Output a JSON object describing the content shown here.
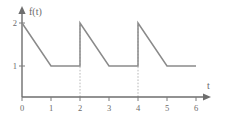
{
  "chart_data": {
    "type": "line",
    "title": "",
    "subtitle": "",
    "xlabel": "t",
    "ylabel": "f(t)",
    "xlim": [
      0,
      6
    ],
    "ylim": [
      0,
      2.3
    ],
    "grid": false,
    "legend": null,
    "x_ticks": [
      "0",
      "1",
      "2",
      "3",
      "4",
      "5",
      "6"
    ],
    "x_tick_values": [
      0,
      1,
      2,
      3,
      4,
      5,
      6
    ],
    "y_ticks": [
      "1",
      "2"
    ],
    "y_tick_values": [
      1,
      2
    ],
    "period": 2,
    "series": [
      {
        "name": "f(t)",
        "color": "#8a8a8a",
        "points": [
          {
            "x": 0,
            "y": 2
          },
          {
            "x": 1,
            "y": 1
          },
          {
            "x": 2,
            "y": 1
          },
          {
            "x": 2,
            "y": 2
          },
          {
            "x": 3,
            "y": 1
          },
          {
            "x": 4,
            "y": 1
          },
          {
            "x": 4,
            "y": 2
          },
          {
            "x": 5,
            "y": 1
          },
          {
            "x": 6,
            "y": 1
          }
        ]
      }
    ],
    "dashed_verticals": [
      {
        "x": 2,
        "y_from": 0,
        "y_to": 2
      },
      {
        "x": 4,
        "y_from": 0,
        "y_to": 2
      }
    ],
    "annotations": []
  },
  "axes": {
    "y_axis_label": "f(t)",
    "x_axis_label": "t"
  }
}
